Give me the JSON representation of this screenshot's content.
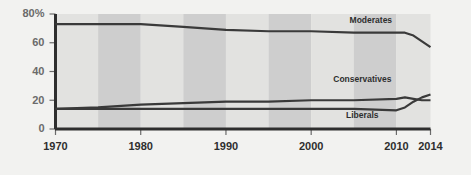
{
  "chart_data": {
    "type": "line",
    "title": "",
    "subtitle": "",
    "xlabel": "",
    "ylabel": "",
    "xlim": [
      1970,
      2014
    ],
    "ylim": [
      0,
      80
    ],
    "grid": false,
    "legend_position": "inline-labels",
    "y_ticks": [
      0,
      20,
      40,
      60,
      80
    ],
    "y_tick_labels": [
      "0",
      "20",
      "40",
      "60",
      "80%"
    ],
    "x_ticks": [
      1970,
      1980,
      1990,
      2000,
      2010,
      2014
    ],
    "x_tick_labels": [
      "1970",
      "1980",
      "1990",
      "2000",
      "2010",
      "2014"
    ],
    "background_bands": {
      "note": "alternating vertical shading every 5 years",
      "interval_years": 5,
      "color_light": "#e2e2e0",
      "color_dark": "#cecece"
    },
    "series": [
      {
        "name": "Moderates",
        "color": "#3a3a3a",
        "label_x": 2007,
        "label_y": 74,
        "x": [
          1970,
          1975,
          1980,
          1985,
          1990,
          1995,
          2000,
          2005,
          2010,
          2011,
          2012,
          2013,
          2014
        ],
        "values": [
          73,
          73,
          73,
          71,
          69,
          68,
          68,
          67,
          67,
          67,
          65,
          61,
          57
        ]
      },
      {
        "name": "Conservatives",
        "color": "#3a3a3a",
        "label_x": 2006,
        "label_y": 33,
        "x": [
          1970,
          1975,
          1980,
          1985,
          1990,
          1995,
          2000,
          2005,
          2010,
          2011,
          2012,
          2013,
          2014
        ],
        "values": [
          14,
          15,
          17,
          18,
          19,
          19,
          20,
          20,
          21,
          22,
          21,
          20,
          20
        ]
      },
      {
        "name": "Liberals",
        "color": "#3a3a3a",
        "label_x": 2006,
        "label_y": 8,
        "x": [
          1970,
          1975,
          1980,
          1985,
          1990,
          1995,
          2000,
          2005,
          2010,
          2011,
          2012,
          2013,
          2014
        ],
        "values": [
          14,
          14,
          14,
          14,
          14,
          14,
          14,
          14,
          13,
          15,
          19,
          22,
          24
        ]
      }
    ],
    "colors": {
      "line": "#3a3a3a",
      "axis": "#2e2e2e",
      "tick_label": "#6b6b6b",
      "x_tick_label": "#2e2e2e",
      "page_background": "#f2f2f0"
    }
  }
}
